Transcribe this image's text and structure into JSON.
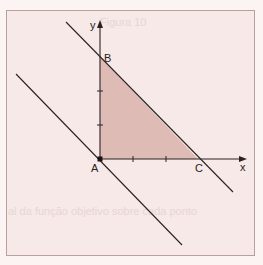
{
  "diagram": {
    "type": "coordinate-geometry",
    "axes": {
      "x_label": "x",
      "y_label": "y",
      "x_ticks": [
        1,
        2
      ],
      "y_ticks": [
        1,
        2
      ]
    },
    "points": [
      {
        "id": "A",
        "label": "A",
        "coords": [
          0,
          0
        ]
      },
      {
        "id": "B",
        "label": "B",
        "coords": [
          0,
          3
        ]
      },
      {
        "id": "C",
        "label": "C",
        "coords": [
          3,
          0
        ]
      }
    ],
    "region": {
      "name": "triangle ABC",
      "vertices": [
        "A",
        "B",
        "C"
      ],
      "fill_color": "#d9b4ab"
    },
    "lines": [
      {
        "name": "line-through-B-and-C",
        "equation": "x + y = 3"
      },
      {
        "name": "parallel-line-through-A",
        "equation": "x + y = 0"
      }
    ],
    "colors": {
      "background": "#f6e9e7",
      "frame_border": "#b8a09b",
      "line": "#2a2222",
      "region": "#d9b4ab"
    }
  },
  "bleed_through": {
    "top": "Figura 10",
    "middle": "al da função objetivo sobre cada ponto"
  }
}
